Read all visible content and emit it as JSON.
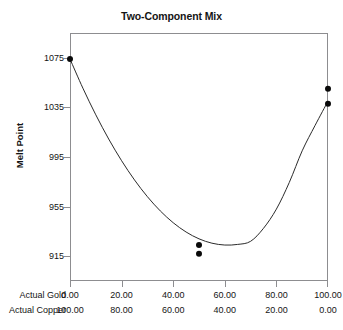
{
  "chart_data": {
    "type": "scatter",
    "title": "Two-Component Mix",
    "xlabel": "",
    "ylabel": "Melt Point",
    "ylim": [
      895,
      1095
    ],
    "yticks": [
      915,
      955,
      995,
      1035,
      1075
    ],
    "ytick_labels": [
      "1075",
      "1035",
      "995",
      "955",
      "915"
    ],
    "xlim": [
      0,
      100
    ],
    "grid": false,
    "legend": null,
    "axes": [
      {
        "name": "Actual Gold",
        "ticks": [
          0,
          20,
          40,
          60,
          80,
          100
        ],
        "tick_labels": [
          "0.00",
          "20.00",
          "40.00",
          "60.00",
          "80.00",
          "100.00"
        ]
      },
      {
        "name": "Actual Copper",
        "ticks": [
          0,
          20,
          40,
          60,
          80,
          100
        ],
        "tick_labels": [
          "100.00",
          "80.00",
          "60.00",
          "40.00",
          "20.00",
          "0.00"
        ]
      }
    ],
    "points": [
      {
        "x": 0,
        "y": 1074
      },
      {
        "x": 50,
        "y": 924
      },
      {
        "x": 50,
        "y": 917
      },
      {
        "x": 100,
        "y": 1050
      },
      {
        "x": 100,
        "y": 1038
      }
    ],
    "series": [
      {
        "name": "fitted-curve",
        "type": "line",
        "x": [
          0,
          5,
          10,
          15,
          20,
          25,
          30,
          35,
          40,
          45,
          50,
          55,
          60,
          65,
          70,
          75,
          80,
          85,
          90,
          95,
          100
        ],
        "y": [
          1074.0,
          1050.5,
          1029.0,
          1009.5,
          992.0,
          976.5,
          963.0,
          951.5,
          942.0,
          934.5,
          929.0,
          925.5,
          924.0,
          924.5,
          927.0,
          937.5,
          953.0,
          974.5,
          1000.0,
          1020.5,
          1040.0
        ]
      }
    ]
  }
}
